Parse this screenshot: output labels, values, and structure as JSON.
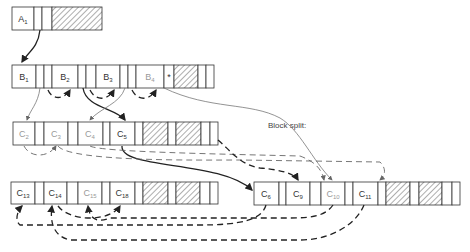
{
  "diagram": {
    "annotation": "Block split:",
    "rows": {
      "A": {
        "keys": [
          {
            "base": "A",
            "sub": "1",
            "faded": false
          }
        ]
      },
      "B": {
        "keys": [
          {
            "base": "B",
            "sub": "1",
            "faded": false
          },
          {
            "base": "B",
            "sub": "2",
            "faded": false
          },
          {
            "base": "B",
            "sub": "3",
            "faded": false
          },
          {
            "base": "B",
            "sub": "4",
            "faded": true
          }
        ],
        "marker": "*"
      },
      "C_left_top": {
        "keys": [
          {
            "base": "C",
            "sub": "2",
            "faded": true
          },
          {
            "base": "C",
            "sub": "3",
            "faded": true
          },
          {
            "base": "C",
            "sub": "4",
            "faded": true
          },
          {
            "base": "C",
            "sub": "5",
            "faded": false
          }
        ]
      },
      "C_left_bottom": {
        "keys": [
          {
            "base": "C",
            "sub": "13",
            "faded": false
          },
          {
            "base": "C",
            "sub": "14",
            "faded": false
          },
          {
            "base": "C",
            "sub": "15",
            "faded": true
          },
          {
            "base": "C",
            "sub": "18",
            "faded": false
          }
        ]
      },
      "C_right": {
        "keys": [
          {
            "base": "C",
            "sub": "6",
            "faded": false
          },
          {
            "base": "C",
            "sub": "9",
            "faded": false
          },
          {
            "base": "C",
            "sub": "10",
            "faded": true
          },
          {
            "base": "C",
            "sub": "11",
            "faded": false
          }
        ]
      }
    }
  }
}
